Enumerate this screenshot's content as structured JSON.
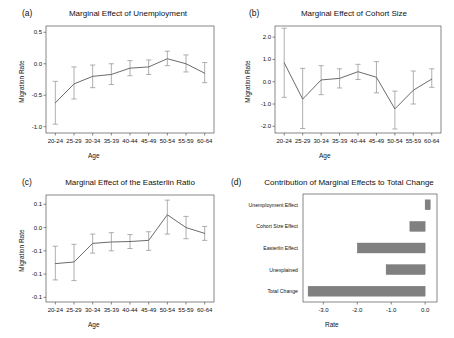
{
  "figure": {
    "panel_a_tag": "(a)",
    "panel_b_tag": "(b)",
    "panel_c_tag": "(c)",
    "panel_d_tag": "(d)"
  },
  "chart_data": [
    {
      "panel": "(a)",
      "type": "line",
      "title": "Marginal Effect of Unemployment",
      "xlabel": "Age",
      "ylabel": "Migration Rate",
      "categories": [
        "20-24",
        "25-29",
        "30-34",
        "35-39",
        "40-44",
        "45-49",
        "50-54",
        "55-59",
        "60-64"
      ],
      "values": [
        -0.62,
        -0.32,
        -0.2,
        -0.17,
        -0.07,
        -0.05,
        0.08,
        0.0,
        -0.15
      ],
      "err_low": [
        -0.96,
        -0.56,
        -0.38,
        -0.33,
        -0.19,
        -0.17,
        -0.03,
        -0.13,
        -0.3
      ],
      "err_high": [
        -0.28,
        -0.05,
        -0.02,
        0.0,
        0.05,
        0.06,
        0.2,
        0.14,
        0.02
      ],
      "yticks": [
        0.5,
        0.0,
        -0.5,
        -1.0
      ],
      "yticklabels": [
        "0.5",
        "0.0",
        "-0.5",
        "-1.0"
      ],
      "ylim": [
        -1.1,
        0.6
      ],
      "grid": false,
      "legend": "none"
    },
    {
      "panel": "(b)",
      "type": "line",
      "title": "Marginal Effect of Cohort Size",
      "xlabel": "Age",
      "ylabel": "Migration Rate",
      "categories": [
        "20-24",
        "25-29",
        "30-34",
        "35-39",
        "40-44",
        "45-49",
        "50-54",
        "55-59",
        "60-64"
      ],
      "values": [
        0.85,
        -0.78,
        0.08,
        0.15,
        0.45,
        0.2,
        -1.22,
        -0.38,
        0.12
      ],
      "err_low": [
        -0.7,
        -2.1,
        -0.58,
        -0.28,
        0.1,
        -0.5,
        -2.12,
        -1.0,
        -0.25
      ],
      "err_high": [
        2.4,
        0.6,
        0.72,
        0.58,
        0.78,
        0.9,
        -0.42,
        0.48,
        0.58
      ],
      "yticks": [
        2.0,
        1.0,
        0.0,
        -1.0,
        -2.0
      ],
      "yticklabels": [
        "2.0",
        "1.0",
        "0.0",
        "-1.0",
        "-2.0"
      ],
      "ylim": [
        -2.3,
        2.5
      ],
      "grid": false,
      "legend": "none"
    },
    {
      "panel": "(c)",
      "type": "line",
      "title": "Marginal Effect of the Easterlin Ratio",
      "xlabel": "Age",
      "ylabel": "Migration Rate",
      "categories": [
        "20-24",
        "25-29",
        "30-34",
        "35-39",
        "40-44",
        "45-49",
        "50-54",
        "55-59",
        "60-64"
      ],
      "values": [
        -0.155,
        -0.148,
        -0.068,
        -0.062,
        -0.06,
        -0.055,
        0.055,
        0.0,
        -0.025
      ],
      "err_low": [
        -0.225,
        -0.228,
        -0.11,
        -0.1,
        -0.09,
        -0.098,
        -0.028,
        -0.048,
        -0.055
      ],
      "err_high": [
        -0.08,
        -0.072,
        -0.028,
        -0.022,
        -0.03,
        -0.018,
        0.118,
        0.048,
        0.005
      ],
      "yticks": [
        0.1,
        0.0,
        -0.1,
        -0.2,
        -0.3
      ],
      "yticklabels": [
        "0.1",
        "0.0",
        "-0.1",
        "-0.1",
        "-0.1"
      ],
      "ylim": [
        -0.32,
        0.14
      ],
      "grid": false,
      "legend": "none"
    },
    {
      "panel": "(d)",
      "type": "bar",
      "orientation": "horizontal",
      "title": "Contribution of Marginal Effects to Total Change",
      "xlabel": "Rate",
      "ylabel": "",
      "categories": [
        "Unemployment Effect",
        "Cohort Size Effect",
        "Easterlin Effect",
        "Unexplained",
        "Total Change"
      ],
      "values": [
        0.15,
        -0.45,
        -2.0,
        -1.15,
        -3.45
      ],
      "xticks": [
        -3.0,
        -2.0,
        -1.0,
        0.0
      ],
      "xticklabels": [
        "-3.0",
        "-2.0",
        "-1.0",
        "0.0"
      ],
      "xlim": [
        -3.6,
        0.35
      ],
      "bar_color": "#808080",
      "grid": false,
      "legend": "none"
    }
  ]
}
